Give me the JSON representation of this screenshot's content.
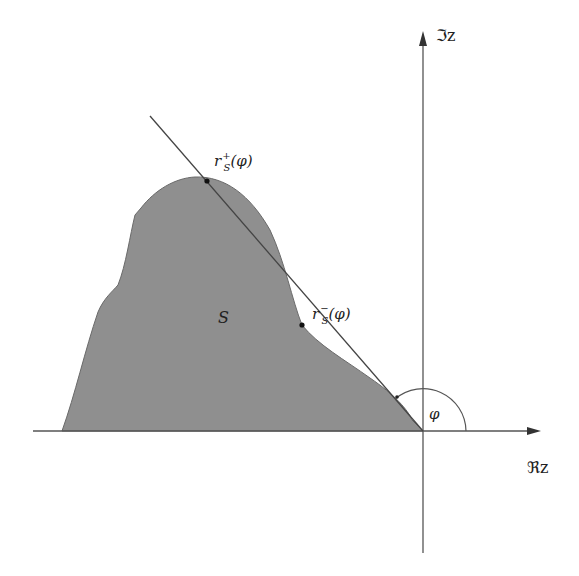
{
  "diagram": {
    "type": "complex-plane region with support ray",
    "colors": {
      "region_fill": "#8f8f8f",
      "axis": "#555555",
      "line": "#444444",
      "background": "#ffffff"
    },
    "axes": {
      "imaginary_label": "ℑz",
      "real_label": "ℜz"
    },
    "region": {
      "label": "S"
    },
    "points": {
      "upper": {
        "base": "r",
        "sup": "+",
        "sub": "S",
        "arg": "(φ)"
      },
      "lower": {
        "base": "r",
        "sup": "−",
        "sub": "S",
        "arg": "(φ)"
      }
    },
    "angle": {
      "label": "φ"
    }
  }
}
